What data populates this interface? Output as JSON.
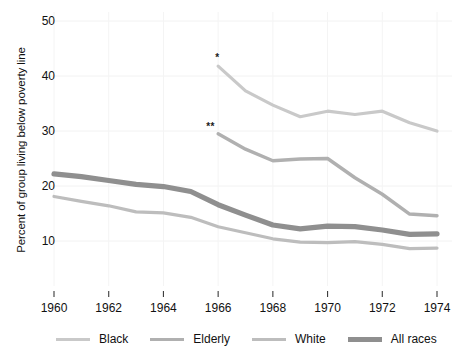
{
  "chart_data": {
    "type": "line",
    "title": "",
    "xlabel": "",
    "ylabel": "Percent of group living below poverty line",
    "xlim": [
      1960,
      1974
    ],
    "ylim": [
      4,
      52
    ],
    "grid": "faint",
    "legend_position": "bottom",
    "x_ticks": [
      1960,
      1962,
      1964,
      1966,
      1968,
      1970,
      1972,
      1974
    ],
    "x_tick_labels": [
      "1960",
      "1962",
      "1964",
      "1966",
      "1968",
      "1970",
      "1972",
      "1974"
    ],
    "y_ticks": [
      10,
      20,
      30,
      40,
      50
    ],
    "y_tick_labels": [
      "10",
      "20",
      "30",
      "40",
      "50"
    ],
    "annotations": [
      {
        "text": "*",
        "x": 1966,
        "y": 43.2,
        "series": "Black"
      },
      {
        "text": "**",
        "x": 1966,
        "y": 30.7,
        "series": "Elderly"
      }
    ],
    "series": [
      {
        "name": "Black",
        "color": "#c9c9c9",
        "width": 3.2,
        "x": [
          1966,
          1967,
          1968,
          1969,
          1970,
          1971,
          1972,
          1973,
          1974
        ],
        "values": [
          41.8,
          37.3,
          34.7,
          32.6,
          33.6,
          33.0,
          33.6,
          31.5,
          30.0
        ]
      },
      {
        "name": "Elderly",
        "color": "#b0b0b0",
        "width": 3.4,
        "x": [
          1966,
          1967,
          1968,
          1969,
          1970,
          1971,
          1972,
          1973,
          1974
        ],
        "values": [
          29.5,
          26.7,
          24.6,
          24.9,
          25.0,
          21.5,
          18.5,
          14.9,
          14.6
        ]
      },
      {
        "name": "White",
        "color": "#bdbdbd",
        "width": 3.2,
        "x": [
          1960,
          1961,
          1962,
          1963,
          1964,
          1965,
          1966,
          1967,
          1968,
          1969,
          1970,
          1971,
          1972,
          1973,
          1974
        ],
        "values": [
          18.1,
          17.2,
          16.4,
          15.3,
          15.1,
          14.3,
          12.6,
          11.5,
          10.4,
          9.8,
          9.7,
          9.9,
          9.4,
          8.6,
          8.7
        ]
      },
      {
        "name": "All races",
        "color": "#8f8f8f",
        "width": 5.2,
        "x": [
          1960,
          1961,
          1962,
          1963,
          1964,
          1965,
          1966,
          1967,
          1968,
          1969,
          1970,
          1971,
          1972,
          1973,
          1974
        ],
        "values": [
          22.2,
          21.7,
          21.0,
          20.3,
          19.9,
          19.0,
          16.6,
          14.7,
          12.9,
          12.2,
          12.7,
          12.6,
          12.0,
          11.2,
          11.3
        ]
      }
    ]
  },
  "legend": {
    "items": [
      {
        "label": "Black",
        "color": "#c9c9c9",
        "thickness": 3
      },
      {
        "label": "Elderly",
        "color": "#b0b0b0",
        "thickness": 3
      },
      {
        "label": "White",
        "color": "#bdbdbd",
        "thickness": 3
      },
      {
        "label": "All races",
        "color": "#8f8f8f",
        "thickness": 5
      }
    ]
  },
  "axes": {
    "y_title": "Percent of group living below poverty line"
  }
}
